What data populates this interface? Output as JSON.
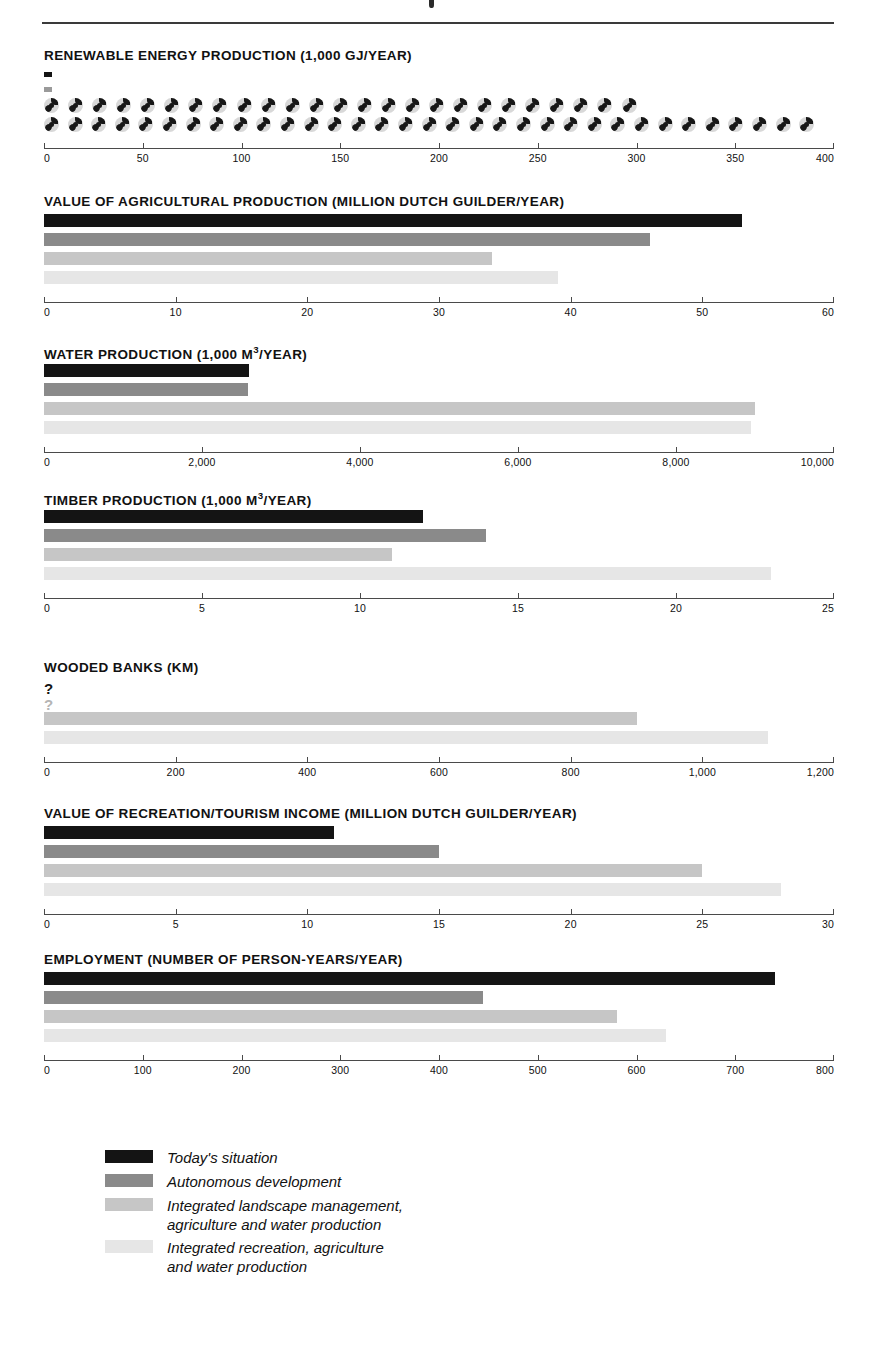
{
  "figure": {
    "series_names": [
      "Today's situation",
      "Autonomous development",
      "Integrated landscape management, agriculture and water production",
      "Integrated recreation, agriculture and water production"
    ],
    "series_colors": [
      "#141414",
      "#8a8a8a",
      "#c6c6c6",
      "#e6e6e6"
    ]
  },
  "legend": {
    "items": [
      {
        "label": "Today's situation",
        "color": "#141414"
      },
      {
        "label": "Autonomous development",
        "color": "#8a8a8a"
      },
      {
        "label": "Integrated landscape management,\nagriculture and water production",
        "color": "#c6c6c6"
      },
      {
        "label": "Integrated recreation, agriculture\nand water production",
        "color": "#e6e6e6"
      }
    ]
  },
  "chart_data": [
    {
      "type": "bar",
      "title": "RENEWABLE ENERGY PRODUCTION (1,000 GJ/YEAR)",
      "unit": "1,000 GJ/year",
      "orientation": "horizontal",
      "xlabel": "",
      "ylabel": "",
      "xlim": [
        0,
        400
      ],
      "ticks": [
        0,
        50,
        100,
        150,
        200,
        250,
        300,
        350,
        400
      ],
      "ticklabels": [
        "0",
        "50",
        "100",
        "150",
        "200",
        "250",
        "300",
        "350",
        "400"
      ],
      "categories": [
        "Today's situation",
        "Autonomous development",
        "Integrated landscape management, agriculture and water production",
        "Integrated recreation, agriculture and water production"
      ],
      "values": [
        4,
        4,
        300,
        390
      ],
      "marks": [
        "stub",
        "stub",
        "pictogram",
        "pictogram"
      ],
      "pictogram_icon": "wind-turbine-icon",
      "pictogram_counts": [
        0,
        0,
        25,
        33
      ],
      "grid": false
    },
    {
      "type": "bar",
      "title": "VALUE OF AGRICULTURAL PRODUCTION (MILLION DUTCH GUILDER/YEAR)",
      "unit": "million Dutch guilder/year",
      "orientation": "horizontal",
      "xlabel": "",
      "ylabel": "",
      "xlim": [
        0,
        60
      ],
      "ticks": [
        0,
        10,
        20,
        30,
        40,
        50,
        60
      ],
      "ticklabels": [
        "0",
        "10",
        "20",
        "30",
        "40",
        "50",
        "60"
      ],
      "categories": [
        "Today's situation",
        "Autonomous development",
        "Integrated landscape management, agriculture and water production",
        "Integrated recreation, agriculture and water production"
      ],
      "values": [
        53,
        46,
        34,
        39
      ],
      "marks": [
        "bar",
        "bar",
        "bar",
        "bar"
      ],
      "grid": false
    },
    {
      "type": "bar",
      "title": "WATER PRODUCTION (1,000 m3/YEAR)",
      "title_html": "WATER PRODUCTION (1,000 m³/YEAR)",
      "unit": "1,000 m³/year",
      "orientation": "horizontal",
      "xlabel": "",
      "ylabel": "",
      "xlim": [
        0,
        10000
      ],
      "ticks": [
        0,
        2000,
        4000,
        6000,
        8000,
        10000
      ],
      "ticklabels": [
        "0",
        "2,000",
        "4,000",
        "6,000",
        "8,000",
        "10,000"
      ],
      "categories": [
        "Today's situation",
        "Autonomous development",
        "Integrated landscape management, agriculture and water production",
        "Integrated recreation, agriculture and water production"
      ],
      "values": [
        2600,
        2580,
        9000,
        8950
      ],
      "marks": [
        "bar",
        "bar",
        "bar",
        "bar"
      ],
      "grid": false
    },
    {
      "type": "bar",
      "title": "TIMBER PRODUCTION (1,000 m3/YEAR)",
      "title_html": "TIMBER PRODUCTION (1,000 m³/YEAR)",
      "unit": "1,000 m³/year",
      "orientation": "horizontal",
      "xlabel": "",
      "ylabel": "",
      "xlim": [
        0,
        25
      ],
      "ticks": [
        0,
        5,
        10,
        15,
        20,
        25
      ],
      "ticklabels": [
        "0",
        "5",
        "10",
        "15",
        "20",
        "25"
      ],
      "categories": [
        "Today's situation",
        "Autonomous development",
        "Integrated landscape management, agriculture and water production",
        "Integrated recreation, agriculture and water production"
      ],
      "values": [
        12,
        14,
        11,
        23
      ],
      "marks": [
        "bar",
        "bar",
        "bar",
        "bar"
      ],
      "grid": false
    },
    {
      "type": "bar",
      "title": "WOODED BANKS (km)",
      "unit": "km",
      "orientation": "horizontal",
      "xlabel": "",
      "ylabel": "",
      "xlim": [
        0,
        1200
      ],
      "ticks": [
        0,
        200,
        400,
        600,
        800,
        1000,
        1200
      ],
      "ticklabels": [
        "0",
        "200",
        "400",
        "600",
        "800",
        "1,000",
        "1,200"
      ],
      "categories": [
        "Today's situation",
        "Autonomous development",
        "Integrated landscape management, agriculture and water production",
        "Integrated recreation, agriculture and water production"
      ],
      "values": [
        null,
        null,
        900,
        1100
      ],
      "marks": [
        "unknown",
        "unknown",
        "bar",
        "bar"
      ],
      "unknown_glyph": "?",
      "grid": false
    },
    {
      "type": "bar",
      "title": "VALUE OF RECREATION/TOURISM INCOME (MILLION DUTCH GUILDER/YEAR)",
      "unit": "million Dutch guilder/year",
      "orientation": "horizontal",
      "xlabel": "",
      "ylabel": "",
      "xlim": [
        0,
        30
      ],
      "ticks": [
        0,
        5,
        10,
        15,
        20,
        25,
        30
      ],
      "ticklabels": [
        "0",
        "5",
        "10",
        "15",
        "20",
        "25",
        "30"
      ],
      "categories": [
        "Today's situation",
        "Autonomous development",
        "Integrated landscape management, agriculture and water production",
        "Integrated recreation, agriculture and water production"
      ],
      "values": [
        11,
        15,
        25,
        28
      ],
      "marks": [
        "bar",
        "bar",
        "bar",
        "bar"
      ],
      "grid": false
    },
    {
      "type": "bar",
      "title": "EMPLOYMENT (NUMBER OF PERSON-YEARS/YEAR)",
      "unit": "number of person-years/year",
      "orientation": "horizontal",
      "xlabel": "",
      "ylabel": "",
      "xlim": [
        0,
        800
      ],
      "ticks": [
        0,
        100,
        200,
        300,
        400,
        500,
        600,
        700,
        800
      ],
      "ticklabels": [
        "0",
        "100",
        "200",
        "300",
        "400",
        "500",
        "600",
        "700",
        "800"
      ],
      "categories": [
        "Today's situation",
        "Autonomous development",
        "Integrated landscape management, agriculture and water production",
        "Integrated recreation, agriculture and water production"
      ],
      "values": [
        740,
        445,
        580,
        630
      ],
      "marks": [
        "bar",
        "bar",
        "bar",
        "bar"
      ],
      "grid": false
    }
  ]
}
